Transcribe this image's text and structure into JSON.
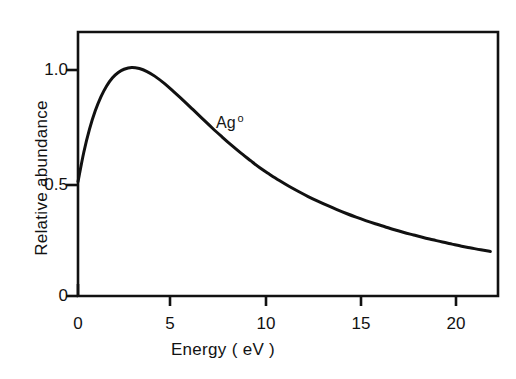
{
  "figure": {
    "background_color": "#ffffff",
    "ink_color": "#111111"
  },
  "chart_data": {
    "type": "line",
    "title": "",
    "subtitle": "",
    "xlabel": "Energy ( eV )",
    "ylabel": "Relative abundance",
    "xlim": [
      0,
      21.9
    ],
    "ylim": [
      0,
      1.155
    ],
    "xticks": [
      0,
      5,
      10,
      15,
      20
    ],
    "xtick_labels": [
      "0",
      "5",
      "10",
      "15",
      "20"
    ],
    "yticks": [
      0,
      0.5,
      1.0
    ],
    "ytick_labels": [
      "0",
      "0.5",
      "1.0"
    ],
    "grid": false,
    "legend": false,
    "legend_position": "none",
    "annotations": [
      {
        "text": "Ag",
        "superscript": "o",
        "full_text": "Ag°",
        "x": 9.0,
        "y": 0.735
      }
    ],
    "series": [
      {
        "name": "Ag°",
        "color": "#111111",
        "line_width": 3,
        "x": [
          0.0,
          0.3,
          0.6,
          0.9,
          1.2,
          1.5,
          1.8,
          2.1,
          2.4,
          2.8,
          3.2,
          3.6,
          4.0,
          4.5,
          5.0,
          5.5,
          6.0,
          6.5,
          7.0,
          7.5,
          8.0,
          8.5,
          9.0,
          9.5,
          10.0,
          10.5,
          11.0,
          11.5,
          12.0,
          12.5,
          13.0,
          13.5,
          14.0,
          14.5,
          15.0,
          15.5,
          16.0,
          16.5,
          17.0,
          17.5,
          18.0,
          18.5,
          19.0,
          19.5,
          20.0,
          20.5,
          21.0,
          21.5
        ],
        "y": [
          0.5,
          0.628,
          0.73,
          0.81,
          0.872,
          0.92,
          0.955,
          0.978,
          0.992,
          1.0,
          0.995,
          0.982,
          0.962,
          0.93,
          0.893,
          0.855,
          0.815,
          0.775,
          0.735,
          0.697,
          0.66,
          0.625,
          0.592,
          0.56,
          0.532,
          0.505,
          0.48,
          0.457,
          0.435,
          0.415,
          0.396,
          0.378,
          0.361,
          0.345,
          0.33,
          0.316,
          0.303,
          0.29,
          0.278,
          0.267,
          0.256,
          0.246,
          0.236,
          0.227,
          0.218,
          0.21,
          0.202,
          0.195
        ]
      }
    ],
    "notes": {
      "curve_start_value": 0.5,
      "peak_x": 2.8,
      "peak_y": 1.0,
      "end_x": 21.5,
      "end_y": 0.195
    }
  }
}
